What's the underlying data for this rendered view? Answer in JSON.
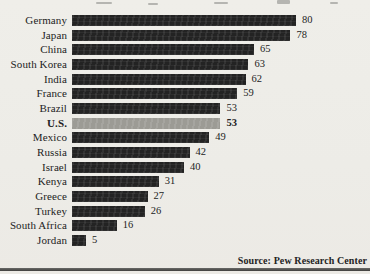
{
  "chart_data": {
    "type": "bar",
    "orientation": "horizontal",
    "title": "",
    "xlabel": "",
    "ylabel": "",
    "xlim": [
      0,
      85
    ],
    "grid": false,
    "legend": false,
    "value_labels_shown": true,
    "categories": [
      "Germany",
      "Japan",
      "China",
      "South Korea",
      "India",
      "France",
      "Brazil",
      "U.S.",
      "Mexico",
      "Russia",
      "Israel",
      "Kenya",
      "Greece",
      "Turkey",
      "South Africa",
      "Jordan"
    ],
    "values": [
      80,
      78,
      65,
      63,
      62,
      59,
      53,
      53,
      49,
      42,
      40,
      31,
      27,
      26,
      16,
      5
    ],
    "highlight_category": "U.S.",
    "bar_color": "#232323",
    "highlight_bar_color": "#9c9b95",
    "source": "Source: Pew Research Center"
  },
  "colors": {
    "background": "#edece7",
    "text": "#232323",
    "bottom_rule": "#4a4a48"
  }
}
